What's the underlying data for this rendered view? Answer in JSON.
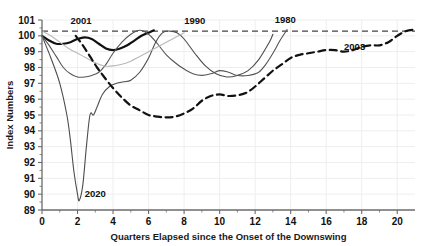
{
  "chart_data": {
    "type": "line",
    "title": "",
    "xlabel": "Quarters Elapsed since the Onset of the Downswing",
    "ylabel": "Index Numbers",
    "xlim": [
      0,
      21
    ],
    "ylim": [
      89,
      101
    ],
    "xticks": [
      0,
      2,
      4,
      6,
      8,
      10,
      12,
      14,
      16,
      18,
      20
    ],
    "yticks": [
      89,
      90,
      91,
      92,
      93,
      94,
      95,
      96,
      97,
      98,
      99,
      100,
      101
    ],
    "grid": true,
    "legend_position": "inline-annotations",
    "reference_line": {
      "label": "100",
      "value": 100.3,
      "style": "dashed"
    },
    "series": [
      {
        "name": "2020",
        "label": "2020",
        "style": "solid",
        "color": "#4d4d4d",
        "width": 1.1,
        "x": [
          0,
          0.5,
          1.0,
          1.4,
          1.6,
          1.8,
          2.0,
          2.1,
          2.3,
          2.5,
          2.7,
          2.9,
          3.1,
          3.4,
          3.8,
          4.2,
          4.6,
          5.0,
          5.5,
          6.0,
          6.4,
          6.8,
          7.2,
          7.6,
          8.0,
          8.6,
          9.2,
          9.8,
          10.4,
          11.0,
          11.6,
          12.2,
          12.8,
          13.0
        ],
        "y": [
          100.0,
          98.6,
          97.0,
          95.0,
          93.4,
          91.4,
          90.0,
          89.6,
          90.6,
          93.0,
          95.0,
          95.0,
          95.5,
          96.3,
          96.8,
          97.0,
          97.1,
          97.2,
          97.7,
          98.6,
          99.6,
          100.2,
          100.3,
          100.2,
          99.8,
          98.9,
          98.1,
          97.6,
          97.4,
          97.5,
          97.8,
          98.5,
          99.6,
          100.1
        ]
      },
      {
        "name": "2001",
        "label": "2001",
        "style": "solid-bold",
        "color": "#111111",
        "width": 2.2,
        "x": [
          0,
          0.4,
          0.8,
          1.2,
          1.6,
          2.0,
          2.4,
          2.8,
          3.2,
          3.6,
          4.0,
          4.4,
          4.8,
          5.2,
          5.6,
          6.0,
          6.3
        ],
        "y": [
          100.0,
          99.7,
          99.5,
          99.5,
          99.6,
          99.8,
          99.9,
          99.8,
          99.5,
          99.2,
          99.1,
          99.2,
          99.4,
          99.7,
          100.0,
          100.2,
          100.35
        ]
      },
      {
        "name": "1990",
        "label": "1990",
        "style": "solid-thin",
        "color": "#555555",
        "width": 1.1,
        "x": [
          0,
          0.4,
          0.8,
          1.2,
          1.6,
          2.0,
          2.4,
          2.8,
          3.2,
          3.6,
          4.0,
          4.5,
          5.0,
          5.5,
          6.0,
          6.5,
          7.0,
          7.5,
          8.0,
          8.5,
          9.0,
          9.5,
          10.0,
          10.5,
          11.0,
          11.6,
          12.2,
          12.6,
          13.0,
          13.4,
          13.8
        ],
        "y": [
          100.0,
          99.4,
          98.7,
          98.0,
          97.6,
          97.4,
          97.4,
          97.5,
          97.7,
          98.2,
          98.9,
          99.6,
          100.1,
          100.35,
          100.1,
          99.5,
          98.8,
          98.3,
          97.9,
          97.6,
          97.5,
          97.6,
          97.8,
          97.7,
          97.5,
          97.5,
          97.7,
          98.2,
          98.9,
          99.7,
          100.4
        ]
      },
      {
        "name": "1980",
        "label": "1980",
        "style": "solid-light",
        "color": "#b8b8b8",
        "width": 1.1,
        "x": [
          0,
          0.5,
          1.0,
          1.5,
          2.0,
          2.5,
          3.0,
          3.5,
          4.0,
          4.5,
          5.0,
          5.5,
          6.0,
          6.5,
          7.0,
          7.5,
          8.0
        ],
        "y": [
          100.3,
          100.0,
          99.6,
          99.2,
          98.9,
          98.6,
          98.3,
          98.1,
          98.1,
          98.2,
          98.4,
          98.7,
          99.0,
          99.3,
          99.6,
          99.9,
          100.2
        ]
      },
      {
        "name": "2008",
        "label": "2008",
        "style": "dashed",
        "color": "#111111",
        "width": 2.2,
        "x": [
          1.9,
          2.3,
          2.7,
          3.1,
          3.5,
          4.0,
          4.5,
          5.0,
          5.5,
          6.0,
          6.5,
          7.0,
          7.5,
          8.0,
          8.5,
          9.0,
          9.5,
          10.0,
          10.5,
          11.0,
          11.5,
          12.0,
          12.5,
          13.0,
          13.5,
          14.0,
          14.5,
          15.0,
          15.5,
          16.0,
          16.5,
          17.0,
          17.5,
          18.0,
          18.5,
          19.0,
          19.5,
          20.0,
          20.5,
          21.0
        ],
        "y": [
          100.0,
          99.4,
          98.7,
          98.0,
          97.4,
          96.7,
          96.1,
          95.6,
          95.3,
          95.0,
          94.9,
          94.85,
          94.9,
          95.1,
          95.4,
          95.9,
          96.2,
          96.3,
          96.2,
          96.25,
          96.4,
          96.8,
          97.3,
          97.8,
          98.2,
          98.6,
          98.8,
          98.9,
          99.0,
          99.1,
          99.1,
          99.0,
          99.1,
          99.3,
          99.4,
          99.4,
          99.6,
          100.0,
          100.3,
          100.4
        ]
      }
    ],
    "annotations": [
      {
        "text": "2001",
        "x": 2.2,
        "y": 100.75
      },
      {
        "text": "1990",
        "x": 8.6,
        "y": 100.75
      },
      {
        "text": "1980",
        "x": 13.7,
        "y": 100.8
      },
      {
        "text": "2008",
        "x": 17.6,
        "y": 99.1
      },
      {
        "text": "2020",
        "x": 3.0,
        "y": 89.85
      }
    ]
  },
  "axes": {
    "y_title": "Index Numbers",
    "x_title": "Quarters Elapsed since the Onset of the Downswing",
    "y_tick_labels": [
      "101",
      "100",
      "99",
      "98",
      "97",
      "96",
      "95",
      "94",
      "93",
      "92",
      "91",
      "90",
      "89"
    ],
    "x_tick_labels": [
      "0",
      "2",
      "4",
      "6",
      "8",
      "10",
      "12",
      "14",
      "16",
      "18",
      "20"
    ]
  },
  "colors": {
    "axis": "#6b6b6b",
    "grid": "#eeeeee",
    "text": "#111111",
    "reference": "#444444"
  }
}
